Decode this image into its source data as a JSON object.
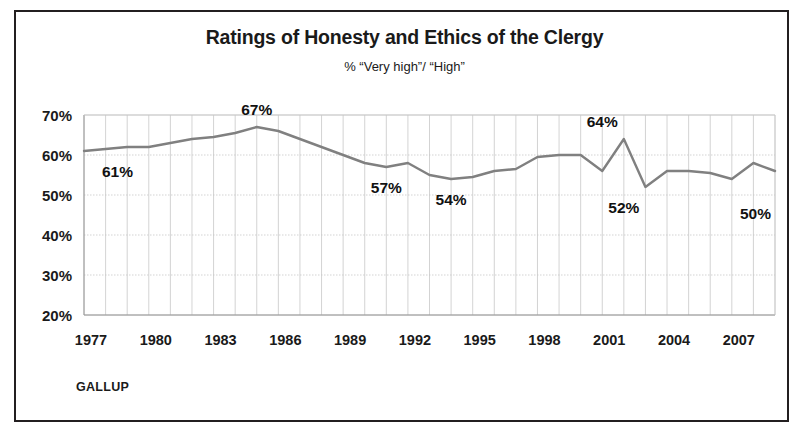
{
  "figure": {
    "source_label": "GALLUP",
    "border_color": "#231f20",
    "background": "#ffffff"
  },
  "chart_data": {
    "type": "line",
    "title": "Ratings of Honesty and Ethics of the Clergy",
    "subtitle": "% “Very high”/ “High”",
    "xlabel": "",
    "ylabel": "",
    "ylim": [
      20,
      70
    ],
    "xlim": [
      1977,
      2009
    ],
    "grid": true,
    "legend": false,
    "line_color": "#808080",
    "gridline_color": "#c8c8c8",
    "axis_color": "#969696",
    "ytick_labels": [
      "70%",
      "60%",
      "50%",
      "40%",
      "30%",
      "20%"
    ],
    "ytick_values": [
      70,
      60,
      50,
      40,
      30,
      20
    ],
    "xtick_labels": [
      "1977",
      "1980",
      "1983",
      "1986",
      "1989",
      "1992",
      "1995",
      "1998",
      "2001",
      "2004",
      "2007"
    ],
    "xtick_values": [
      1977,
      1980,
      1983,
      1986,
      1989,
      1992,
      1995,
      1998,
      2001,
      2004,
      2007
    ],
    "x": [
      1977,
      1978,
      1979,
      1980,
      1981,
      1982,
      1983,
      1984,
      1985,
      1986,
      1987,
      1988,
      1989,
      1990,
      1991,
      1992,
      1993,
      1994,
      1995,
      1996,
      1997,
      1998,
      1999,
      2000,
      2001,
      2002,
      2003,
      2004,
      2005,
      2006,
      2007,
      2008,
      2009
    ],
    "values": [
      61,
      61.5,
      62,
      62,
      63,
      64,
      64.5,
      65.5,
      67,
      66,
      64,
      62,
      60,
      58,
      57,
      58,
      55,
      54,
      54.5,
      56,
      56.5,
      59.5,
      60,
      60,
      56,
      64,
      52,
      56,
      56,
      55.5,
      54,
      58,
      56
    ],
    "annotations": [
      {
        "label": "61%",
        "x": 1977,
        "value": 61,
        "position": "below-right"
      },
      {
        "label": "67%",
        "x": 1985,
        "value": 67,
        "position": "above"
      },
      {
        "label": "57%",
        "x": 1991,
        "value": 57,
        "position": "below"
      },
      {
        "label": "54%",
        "x": 1994,
        "value": 54,
        "position": "below"
      },
      {
        "label": "64%",
        "x": 2001,
        "value": 64,
        "position": "above"
      },
      {
        "label": "52%",
        "x": 2002,
        "value": 52,
        "position": "below"
      },
      {
        "label": "50%",
        "x": 2009,
        "value": 50,
        "position": "below-left"
      }
    ]
  }
}
